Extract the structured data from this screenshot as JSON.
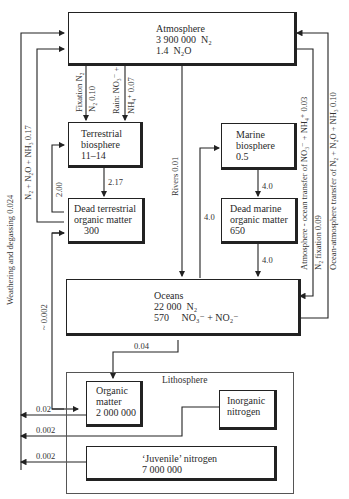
{
  "atmosphere": {
    "title": "Atmosphere",
    "line1_value": "3 900 000",
    "line1_species": "N₂",
    "line2_value": "1.4",
    "line2_species": "N₂O"
  },
  "terrestrial_biosphere": {
    "line1": "Terrestrial",
    "line2": "biosphere",
    "value": "11–14"
  },
  "dead_terrestrial": {
    "line1": "Dead terrestrial",
    "line2": "organic matter",
    "value": "300"
  },
  "marine_biosphere": {
    "line1": "Marine",
    "line2": "biosphere",
    "value": "0.5"
  },
  "dead_marine": {
    "line1": "Dead marine",
    "line2": "organic matter",
    "value": "650"
  },
  "oceans": {
    "title": "Oceans",
    "line1_value": "22 000",
    "line1_species": "N₂",
    "line2_value": "570",
    "line2_species": "NO₃⁻ + NO₂⁻"
  },
  "lithosphere": {
    "title": "Lithosphere",
    "organic_matter": {
      "line1": "Organic",
      "line2": "matter",
      "value": "2 000 000"
    },
    "inorganic_nitrogen": {
      "line1": "Inorganic",
      "line2": "nitrogen"
    },
    "juvenile_nitrogen": {
      "line1": "‘Juvenile’ nitrogen",
      "value": "7 000 000"
    }
  },
  "flows": {
    "fixation_a": "Fixation N₂",
    "fixation_b": "N₂ 0.10",
    "rain_a": "Rain: NO₃⁻ +",
    "rain_b": "NH₄⁺ 0.07",
    "terr_to_dead": "2.17",
    "dead_to_terr": "2.00",
    "land_to_atm": "N₂ + N₂O + NH₃ 0.17",
    "weathering": "Weathering and degassing 0.024",
    "rivers": "Rivers 0.01",
    "marine_to_dead": "4.0",
    "dead_marine_to_ocean": "4.0",
    "ocean_to_marine": "4.0",
    "atm_ocean_transfer": "Atmosphere - ocean transfer of NO₃⁻ + NH₄⁺ 0.03",
    "ocean_n2_fixation": "N₂ fixation 0.09",
    "ocean_atm_transfer": "Ocean-atmosphere transfer of N₂ + N₂O + NH₃ 0.10",
    "ocean_to_litho": "0.04",
    "litho_to_dead_terr": "~ 0.002",
    "organic_out": "0.02",
    "inorganic_out": "0.002",
    "juvenile_out": "0.002"
  }
}
